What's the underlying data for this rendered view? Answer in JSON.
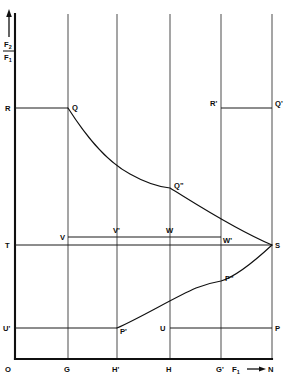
{
  "figure": {
    "background_color": "#ffffff",
    "line_color": "#101010"
  },
  "axes": {
    "y_axis": {
      "label_numerator": "F",
      "label_numerator_sub": "2",
      "label_denominator": "F",
      "label_denominator_sub": "1",
      "arrow_direction": "up",
      "origin_label": "O"
    },
    "x_axis": {
      "label": "F",
      "label_sub": "1",
      "arrow_direction": "right",
      "end_label": "N"
    }
  },
  "x_ticks": [
    {
      "name": "O",
      "label": "O",
      "x": 15
    },
    {
      "name": "G",
      "label": "G",
      "x": 68
    },
    {
      "name": "Hp",
      "label": "H'",
      "x": 117
    },
    {
      "name": "H",
      "label": "H",
      "x": 170
    },
    {
      "name": "Gp",
      "label": "G'",
      "x": 221
    },
    {
      "name": "N",
      "label": "N",
      "x": 272
    }
  ],
  "y_levels": [
    {
      "name": "R",
      "label": "R",
      "y": 108
    },
    {
      "name": "T",
      "label": "T",
      "y": 245
    },
    {
      "name": "Up",
      "label": "U'",
      "y": 328
    }
  ],
  "points": [
    {
      "name": "R",
      "label": "R",
      "x": 15,
      "y": 108,
      "label_pos": "left"
    },
    {
      "name": "Q",
      "label": "Q",
      "x": 68,
      "y": 108,
      "label_pos": "right-up"
    },
    {
      "name": "Rp",
      "label": "R'",
      "x": 221,
      "y": 108,
      "label_pos": "left"
    },
    {
      "name": "Qp",
      "label": "Q'",
      "x": 272,
      "y": 108,
      "label_pos": "right"
    },
    {
      "name": "Qpp",
      "label": "Q\"",
      "x": 170,
      "y": 188,
      "label_pos": "right"
    },
    {
      "name": "V",
      "label": "V",
      "x": 68,
      "y": 237,
      "label_pos": "left"
    },
    {
      "name": "Vp",
      "label": "V'",
      "x": 117,
      "y": 237,
      "label_pos": "above"
    },
    {
      "name": "W",
      "label": "W",
      "x": 170,
      "y": 237,
      "label_pos": "above"
    },
    {
      "name": "Wp",
      "label": "W'",
      "x": 221,
      "y": 237,
      "label_pos": "right"
    },
    {
      "name": "T",
      "label": "T",
      "x": 15,
      "y": 245,
      "label_pos": "left"
    },
    {
      "name": "S",
      "label": "S",
      "x": 272,
      "y": 245,
      "label_pos": "right"
    },
    {
      "name": "Ppp",
      "label": "P\"",
      "x": 221,
      "y": 281,
      "label_pos": "right"
    },
    {
      "name": "Up",
      "label": "U'",
      "x": 15,
      "y": 328,
      "label_pos": "left"
    },
    {
      "name": "Pp",
      "label": "P'",
      "x": 117,
      "y": 328,
      "label_pos": "right"
    },
    {
      "name": "U",
      "label": "U",
      "x": 170,
      "y": 328,
      "label_pos": "left"
    },
    {
      "name": "P",
      "label": "P",
      "x": 272,
      "y": 328,
      "label_pos": "right"
    }
  ],
  "segments": [
    {
      "name": "R-Q",
      "from": "R",
      "to": "Q",
      "style": "aux"
    },
    {
      "name": "Rp-Qp",
      "from": "R'",
      "to": "Q'",
      "style": "aux"
    },
    {
      "name": "V-Wp",
      "from": "V",
      "to": "W'",
      "style": "aux"
    },
    {
      "name": "T-S",
      "from": "T",
      "to": "S",
      "style": "aux"
    },
    {
      "name": "Up-Pp",
      "from": "U'",
      "to": "P'",
      "style": "aux"
    },
    {
      "name": "U-P",
      "from": "U",
      "to": "P",
      "style": "aux"
    }
  ],
  "curves": [
    {
      "name": "upper-curve",
      "description": "Q to Q\" to S, convex decreasing",
      "path": "M 68 108 C 84 133, 104 160, 130 174 C 146 183, 160 187, 170 188 C 190 200, 232 228, 272 245"
    },
    {
      "name": "lower-curve",
      "description": "P' to P\" to S, concave increasing",
      "path": "M 117 328 C 140 318, 175 297, 196 288 C 206 284, 215 282, 221 281 C 238 276, 258 258, 272 245"
    }
  ],
  "frame": {
    "plot_left": 15,
    "plot_right": 272,
    "plot_top": 14,
    "plot_bottom": 359
  }
}
